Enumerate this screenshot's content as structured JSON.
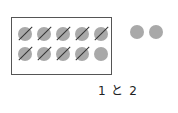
{
  "figure": {
    "ten_frame": {
      "rows": 2,
      "cols": 5,
      "dots": [
        {
          "row": 0,
          "col": 0,
          "crossed": true
        },
        {
          "row": 0,
          "col": 1,
          "crossed": true
        },
        {
          "row": 0,
          "col": 2,
          "crossed": true
        },
        {
          "row": 0,
          "col": 3,
          "crossed": true
        },
        {
          "row": 0,
          "col": 4,
          "crossed": true
        },
        {
          "row": 1,
          "col": 0,
          "crossed": true
        },
        {
          "row": 1,
          "col": 1,
          "crossed": true
        },
        {
          "row": 1,
          "col": 2,
          "crossed": true
        },
        {
          "row": 1,
          "col": 3,
          "crossed": true
        },
        {
          "row": 1,
          "col": 4,
          "crossed": false
        }
      ]
    },
    "extra_dots": 2,
    "dot_color": "#a9a9a9",
    "caption": "1 と 2"
  }
}
